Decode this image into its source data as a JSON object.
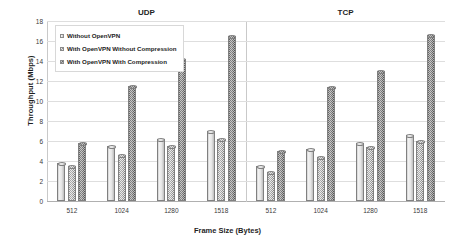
{
  "chart_data": {
    "type": "bar",
    "title": "",
    "xlabel": "Frame Size (Bytes)",
    "ylabel": "Throughput (Mbps)",
    "ylim": [
      0,
      18
    ],
    "yticks": [
      0,
      2,
      4,
      6,
      8,
      10,
      12,
      14,
      16,
      18
    ],
    "grid": true,
    "legend_position": "top-left-inside",
    "panels": [
      {
        "name": "UDP",
        "categories": [
          "512",
          "1024",
          "1280",
          "1518"
        ],
        "series": [
          {
            "name": "Without OpenVPN",
            "values": [
              3.8,
              5.5,
              6.2,
              7.0
            ]
          },
          {
            "name": "With OpenVPN Without Compression",
            "values": [
              3.5,
              4.6,
              5.5,
              6.2
            ]
          },
          {
            "name": "With OpenVPN With Compression",
            "values": [
              5.8,
              11.5,
              14.2,
              16.5
            ]
          }
        ]
      },
      {
        "name": "TCP",
        "categories": [
          "512",
          "1024",
          "1280",
          "1518"
        ],
        "series": [
          {
            "name": "Without OpenVPN",
            "values": [
              3.5,
              5.2,
              5.8,
              6.6
            ]
          },
          {
            "name": "With OpenVPN Without Compression",
            "values": [
              2.9,
              4.4,
              5.4,
              6.0
            ]
          },
          {
            "name": "With OpenVPN With Compression",
            "values": [
              5.0,
              11.4,
              13.0,
              16.6
            ]
          }
        ]
      }
    ],
    "legend": [
      "Without OpenVPN",
      "With OpenVPN Without Compression",
      "With OpenVPN With Compression"
    ],
    "series_colors": [
      "#e8e8e8",
      "#9a9a9a",
      "#6d6d6d"
    ]
  }
}
